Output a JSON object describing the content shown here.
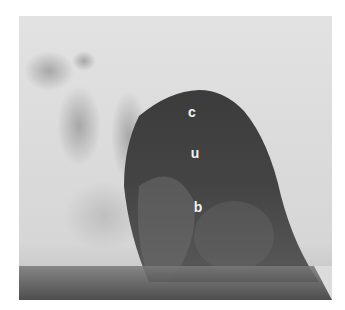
{
  "figure": {
    "type": "radiograph",
    "labels": [
      {
        "id": "c",
        "text": "c"
      },
      {
        "id": "u",
        "text": "u"
      },
      {
        "id": "b",
        "text": "b"
      }
    ],
    "colors": {
      "background": "#ffffff",
      "soft_tissue": "#dcdcdc",
      "dark_region": "#3a3a3a",
      "label": "#f2f2f2"
    }
  }
}
